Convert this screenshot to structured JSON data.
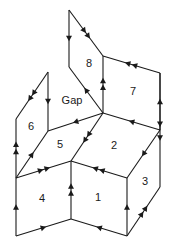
{
  "diagram": {
    "title": "",
    "faces": [
      {
        "id": "1",
        "label": "1"
      },
      {
        "id": "2",
        "label": "2"
      },
      {
        "id": "3",
        "label": "3"
      },
      {
        "id": "4",
        "label": "4"
      },
      {
        "id": "5",
        "label": "5"
      },
      {
        "id": "6",
        "label": "6"
      },
      {
        "id": "7",
        "label": "7"
      },
      {
        "id": "8",
        "label": "8"
      },
      {
        "id": "gap",
        "label": "Gap"
      }
    ],
    "edges": [
      {
        "from": "A",
        "to": "B",
        "arrows": 1
      },
      {
        "from": "A",
        "to": "C",
        "arrows": 2
      },
      {
        "from": "B",
        "to": "E",
        "arrows": 1,
        "dir": "to-B"
      },
      {
        "from": "E",
        "to": "C",
        "arrows": 2
      },
      {
        "from": "D",
        "to": "C",
        "arrows": 2
      },
      {
        "from": "F",
        "to": "D",
        "arrows": 1
      },
      {
        "from": "F",
        "to": "E",
        "arrows": 1
      },
      {
        "from": "D",
        "to": "N",
        "arrows": 2,
        "note": "downward on right side of 3"
      },
      {
        "from": "E",
        "to": "J",
        "arrows": 1
      },
      {
        "from": "H",
        "to": "J",
        "arrows": 1
      },
      {
        "from": "H",
        "to": "I",
        "arrows": 2
      },
      {
        "from": "K",
        "to": "I",
        "arrows": 2
      },
      {
        "from": "K",
        "to": "J",
        "arrows": 1
      },
      {
        "from": "E",
        "to": "L",
        "arrows": 2
      },
      {
        "from": "K",
        "to": "L",
        "arrows": 2
      },
      {
        "from": "M",
        "to": "L",
        "arrows": 2
      },
      {
        "from": "F",
        "to": "M",
        "arrows": 1
      },
      {
        "from": "P",
        "to": "L",
        "arrows": 2
      },
      {
        "from": "O",
        "to": "K",
        "arrows": 1
      },
      {
        "from": "O",
        "to": "P",
        "arrows": 1
      },
      {
        "from": "Q",
        "to": "P",
        "arrows": 1
      },
      {
        "from": "Q",
        "to": "M",
        "arrows": 1
      },
      {
        "from": "Q",
        "to": "N",
        "arrows": 2
      }
    ]
  }
}
